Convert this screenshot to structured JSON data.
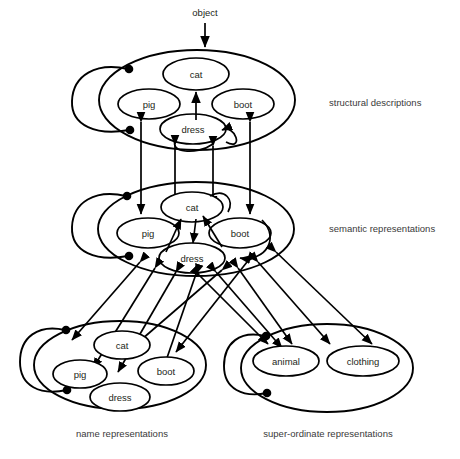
{
  "diagram": {
    "type": "neural-network-architecture",
    "title_text": "",
    "background_color": "#ffffff",
    "line_color": "#000000",
    "text_color": "#231f20",
    "input": {
      "label": "object",
      "arrow_direction": "down",
      "target_layer": "structural descriptions"
    },
    "layers": [
      {
        "id": "structural",
        "label": "structural descriptions",
        "label_position": "right",
        "nodes": [
          {
            "id": "cat",
            "label": "cat"
          },
          {
            "id": "pig",
            "label": "pig"
          },
          {
            "id": "boot",
            "label": "boot"
          },
          {
            "id": "dress",
            "label": "dress"
          }
        ],
        "has_self_inhibition_loop": true,
        "loop_endpoint_style": "filled-circle"
      },
      {
        "id": "semantic",
        "label": "semantic representations",
        "label_position": "right",
        "nodes": [
          {
            "id": "cat",
            "label": "cat"
          },
          {
            "id": "pig",
            "label": "pig"
          },
          {
            "id": "boot",
            "label": "boot"
          },
          {
            "id": "dress",
            "label": "dress"
          }
        ],
        "has_self_inhibition_loop": true,
        "loop_endpoint_style": "filled-circle"
      },
      {
        "id": "name",
        "label": "name representations",
        "label_position": "below",
        "nodes": [
          {
            "id": "cat",
            "label": "cat"
          },
          {
            "id": "pig",
            "label": "pig"
          },
          {
            "id": "boot",
            "label": "boot"
          },
          {
            "id": "dress",
            "label": "dress"
          }
        ],
        "has_self_inhibition_loop": true,
        "loop_endpoint_style": "filled-circle"
      },
      {
        "id": "superordinate",
        "label": "super-ordinate representations",
        "label_position": "below",
        "nodes": [
          {
            "id": "animal",
            "label": "animal"
          },
          {
            "id": "clothing",
            "label": "clothing"
          }
        ],
        "has_self_inhibition_loop": true,
        "loop_endpoint_style": "filled-circle"
      }
    ],
    "connections": [
      {
        "from": "input",
        "to": "structural",
        "style": "arrow",
        "bidirectional": false
      },
      {
        "from": "structural",
        "to": "semantic",
        "style": "arrow",
        "bidirectional": true
      },
      {
        "from": "semantic",
        "to": "name",
        "style": "arrow",
        "bidirectional": true
      },
      {
        "from": "semantic",
        "to": "superordinate",
        "style": "arrow",
        "bidirectional": true
      }
    ]
  }
}
